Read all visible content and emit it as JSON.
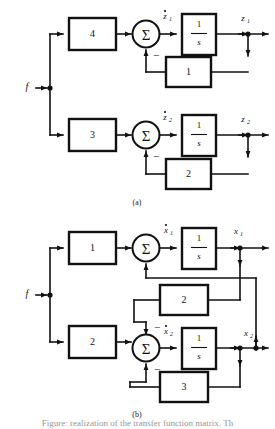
{
  "figure": {
    "type": "block-diagram",
    "caption_a": "(a)",
    "caption_b": "(b)",
    "bottom_caption": "Figure: realization of the transfer function matrix. Th",
    "input_label": "f",
    "colors": {
      "line": "#111111",
      "background": "#ffffff",
      "block_fill": "#ffffff"
    }
  },
  "diagram_a": {
    "label": "(a)",
    "input": "f",
    "channels": [
      {
        "id": "channel-1",
        "forward_gain": "4",
        "integrator_numerator": "1",
        "integrator_denominator": "s",
        "derivative_signal": "z",
        "derivative_subscript": "1",
        "output_signal": "z",
        "output_subscript": "1",
        "feedback_gain": "1",
        "feedback_sign": "−"
      },
      {
        "id": "channel-2",
        "forward_gain": "3",
        "integrator_numerator": "1",
        "integrator_denominator": "s",
        "derivative_signal": "z",
        "derivative_subscript": "2",
        "output_signal": "z",
        "output_subscript": "2",
        "feedback_gain": "2",
        "feedback_sign": "−"
      }
    ]
  },
  "diagram_b": {
    "label": "(b)",
    "input": "f",
    "channels": [
      {
        "id": "channel-1",
        "forward_gain": "1",
        "integrator_numerator": "1",
        "integrator_denominator": "s",
        "derivative_signal": "x",
        "derivative_subscript": "1",
        "output_signal": "x",
        "output_subscript": "1"
      },
      {
        "id": "channel-2",
        "forward_gain": "2",
        "integrator_numerator": "1",
        "integrator_denominator": "s",
        "derivative_signal": "x",
        "derivative_subscript": "2",
        "output_signal": "x",
        "output_subscript": "2"
      }
    ],
    "cross_feedback_gain": "2",
    "local_feedback_gain": "3",
    "feedback_sign_top": "−",
    "feedback_sign_bottom": "−",
    "sigma_symbol": "Σ"
  },
  "symbols": {
    "sigma": "Σ",
    "minus": "−"
  }
}
